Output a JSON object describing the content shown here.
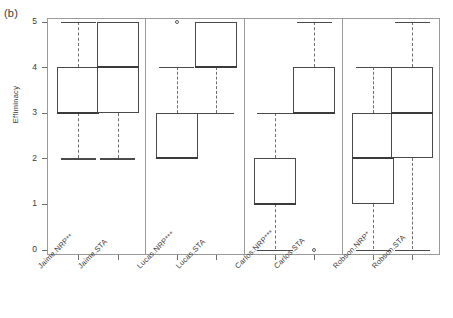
{
  "figure": {
    "panel_label": "(b)",
    "ylabel": "Effiminacy"
  },
  "chart_data": {
    "type": "box",
    "title": "(b)",
    "xlabel": "",
    "ylabel": "Effiminacy",
    "ylim": [
      0,
      5
    ],
    "yticks": [
      0,
      1,
      2,
      3,
      4,
      5
    ],
    "ytick_labels": [
      "0",
      "1",
      "2",
      "3",
      "4",
      "5"
    ],
    "grid": false,
    "legend": null,
    "groups": [
      "Jaime",
      "Lucas",
      "Carlos",
      "Robson"
    ],
    "categories": [
      "Jaime.NRP**",
      "Jaime.STA",
      "Lucas.NRP***",
      "Lucas.STA",
      "Carlos.NRP***",
      "Carlos.STA",
      "Robson.NRP*",
      "Robson.STA"
    ],
    "boxes": [
      {
        "label": "Jaime.NRP**",
        "whisker_low": 2,
        "q1": 3,
        "median": 3,
        "q3": 4,
        "whisker_high": 5,
        "outliers": []
      },
      {
        "label": "Jaime.STA",
        "whisker_low": 2,
        "q1": 3,
        "median": 4,
        "q3": 5,
        "whisker_high": 5,
        "outliers": []
      },
      {
        "label": "Lucas.NRP***",
        "whisker_low": 2,
        "q1": 2,
        "median": 2,
        "q3": 3,
        "whisker_high": 4,
        "outliers": [
          5
        ]
      },
      {
        "label": "Lucas.STA",
        "whisker_low": 3,
        "q1": 4,
        "median": 4,
        "q3": 5,
        "whisker_high": 5,
        "outliers": []
      },
      {
        "label": "Carlos.NRP***",
        "whisker_low": 0,
        "q1": 1,
        "median": 1,
        "q3": 2,
        "whisker_high": 3,
        "outliers": []
      },
      {
        "label": "Carlos.STA",
        "whisker_low": 3,
        "q1": 3,
        "median": 3,
        "q3": 4,
        "whisker_high": 5,
        "outliers": [
          0
        ]
      },
      {
        "label": "Robson.NRP*",
        "whisker_low": 0,
        "q1": 1,
        "median": 2,
        "q3": 3,
        "whisker_high": 4,
        "outliers": []
      },
      {
        "label": "Robson.STA",
        "whisker_low": 0,
        "q1": 2,
        "median": 3,
        "q3": 4,
        "whisker_high": 5,
        "outliers": []
      }
    ]
  }
}
